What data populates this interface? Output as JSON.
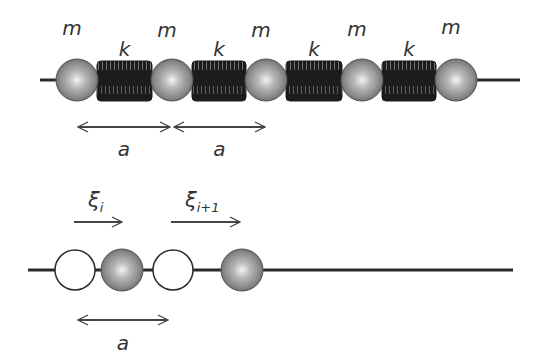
{
  "diagram": {
    "colors": {
      "line": "#2a2a2a",
      "spring": "#1e1e1e",
      "mass_light": "#e8e8e8",
      "mass_dark": "#6a6a6a",
      "label": "#333333",
      "arrow": "#444444"
    },
    "top_chain": {
      "mass_label": "m",
      "spring_label": "k",
      "masses": [
        {
          "label": "m",
          "cx": 77
        },
        {
          "label": "m",
          "cx": 172
        },
        {
          "label": "m",
          "cx": 266
        },
        {
          "label": "m",
          "cx": 362
        },
        {
          "label": "m",
          "cx": 456
        }
      ],
      "springs": [
        {
          "label": "k",
          "x1": 97,
          "x2": 152
        },
        {
          "label": "k",
          "x1": 192,
          "x2": 246
        },
        {
          "label": "k",
          "x1": 286,
          "x2": 342
        },
        {
          "label": "k",
          "x1": 382,
          "x2": 436
        }
      ],
      "spacing_arrows": [
        {
          "label": "a",
          "x1": 78,
          "x2": 170
        },
        {
          "label": "a",
          "x1": 174,
          "x2": 265
        }
      ]
    },
    "bottom_chain": {
      "displacement_arrows": [
        {
          "label": "ξ",
          "subscript": "i",
          "x1": 74,
          "x2": 122
        },
        {
          "label": "ξ",
          "subscript": "i+1",
          "x1": 171,
          "x2": 240
        }
      ],
      "equilibrium_positions": [
        {
          "type": "open-circle",
          "cx": 75
        },
        {
          "type": "open-circle",
          "cx": 173
        }
      ],
      "displaced_masses": [
        {
          "type": "filled-ball",
          "cx": 122
        },
        {
          "type": "filled-ball",
          "cx": 242
        }
      ],
      "spacing_arrow": {
        "label": "a",
        "x1": 78,
        "x2": 168
      }
    }
  }
}
